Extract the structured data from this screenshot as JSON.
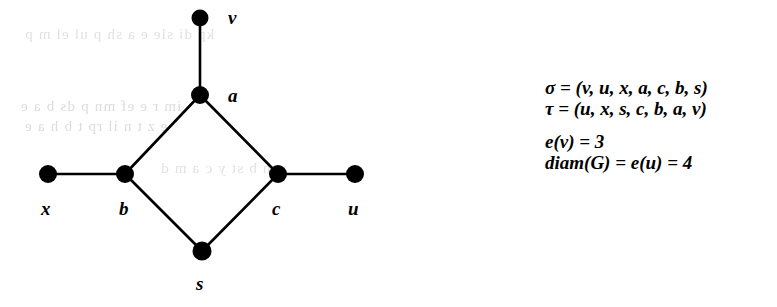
{
  "figure": {
    "type": "graph-diagram",
    "background_color": "#ffffff",
    "ink_color": "#000000"
  },
  "graph": {
    "nodes": [
      {
        "id": "v",
        "label": "v",
        "cx": 200,
        "cy": 18,
        "r": 8,
        "label_x": 228,
        "label_y": 8,
        "label_pos": "right"
      },
      {
        "id": "a",
        "label": "a",
        "cx": 200,
        "cy": 95,
        "r": 9,
        "label_x": 228,
        "label_y": 86,
        "label_pos": "right"
      },
      {
        "id": "x",
        "label": "x",
        "cx": 48,
        "cy": 174,
        "r": 9,
        "label_x": 41,
        "label_y": 199,
        "label_pos": "below"
      },
      {
        "id": "b",
        "label": "b",
        "cx": 125,
        "cy": 174,
        "r": 9,
        "label_x": 119,
        "label_y": 199,
        "label_pos": "below"
      },
      {
        "id": "c",
        "label": "c",
        "cx": 278,
        "cy": 174,
        "r": 9,
        "label_x": 272,
        "label_y": 199,
        "label_pos": "below"
      },
      {
        "id": "u",
        "label": "u",
        "cx": 355,
        "cy": 174,
        "r": 9,
        "label_x": 348,
        "label_y": 199,
        "label_pos": "below"
      },
      {
        "id": "s",
        "label": "s",
        "cx": 202,
        "cy": 251,
        "r": 9,
        "label_x": 196,
        "label_y": 274,
        "label_pos": "below"
      }
    ],
    "edges": [
      {
        "from": "v",
        "to": "a"
      },
      {
        "from": "a",
        "to": "b"
      },
      {
        "from": "a",
        "to": "c"
      },
      {
        "from": "x",
        "to": "b"
      },
      {
        "from": "c",
        "to": "u"
      },
      {
        "from": "b",
        "to": "s"
      },
      {
        "from": "s",
        "to": "c"
      }
    ]
  },
  "annotations": {
    "lines": [
      {
        "id": "sigma-ordering",
        "text": "σ = (v, u, x, a, c, b, s)",
        "symbol": "σ",
        "equals": "=",
        "sequence": [
          "v",
          "u",
          "x",
          "a",
          "c",
          "b",
          "s"
        ]
      },
      {
        "id": "tau-ordering",
        "text": "τ = (u, x, s, c, b, a, v)",
        "symbol": "τ",
        "equals": "=",
        "sequence": [
          "u",
          "x",
          "s",
          "c",
          "b",
          "a",
          "v"
        ]
      },
      {
        "id": "eccentricity-v",
        "text": "e(v) = 3",
        "function": "e",
        "argument": "v",
        "value": "3"
      },
      {
        "id": "diameter",
        "text": "diam(G) = e(u) = 4",
        "function": "diam",
        "argument": "G",
        "second_function": "e",
        "second_argument": "u",
        "value": "4"
      }
    ]
  },
  "ghost_text": {
    "note": "faint illegible show-through from the reverse side of the scanned page",
    "rows": [
      {
        "text": "kp  di  sle  e  a  sh  p  ul  el  m  p",
        "x": 24,
        "y": 26
      },
      {
        "text": "im  r  e  ef  mn  p  ds  b  a  e",
        "x": 20,
        "y": 98
      },
      {
        "text": "e  z  t  n  il  rp  t  b  h  a  e",
        "x": 24,
        "y": 118
      },
      {
        "text": "e  h  b  st  y  c  a  m  d",
        "x": 160,
        "y": 160
      }
    ]
  }
}
